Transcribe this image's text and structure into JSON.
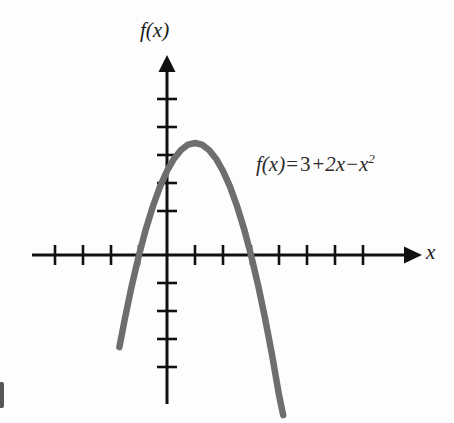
{
  "figure": {
    "background_color": "#fdfdfd",
    "axis_color": "#111111",
    "curve_color": "#6e6e6e",
    "ylabel": "f(x)",
    "xlabel": "x",
    "equation": {
      "lhs": "f(x)",
      "equals": "=",
      "term_constant": "3",
      "op_plus": "+",
      "term_linear": "2x",
      "op_minus": "−",
      "term_quadratic_base": "x",
      "term_quadratic_exponent": "2",
      "full_text": "f(x) = 3 + 2x − x²"
    }
  },
  "chart_data": {
    "type": "line",
    "title": "",
    "subtitle": "",
    "xlabel": "x",
    "ylabel": "f(x)",
    "annotations": [
      {
        "text": "f(x) = 3 + 2x − x²",
        "x": 3.2,
        "y": 3.6
      }
    ],
    "legend": [],
    "legend_position": "none",
    "grid": false,
    "axis_style": "arrows-both-ends",
    "xlim": [
      -4.9,
      7.6
    ],
    "ylim": [
      -4.9,
      5.9
    ],
    "xticks": [
      -4,
      -3,
      -2,
      -1,
      1,
      2,
      3,
      4,
      5,
      6,
      7
    ],
    "yticks": [
      -4,
      -3,
      -2,
      -1,
      1,
      2,
      3,
      4,
      5
    ],
    "xtick_labels": [],
    "ytick_labels": [],
    "function": "f(x) = 3 + 2x - x^2",
    "vertex": {
      "x": 1,
      "y": 4
    },
    "x_intercepts": [
      -1,
      3
    ],
    "y_intercept": 3,
    "opens": "down",
    "domain_drawn": [
      -1.7,
      4.15
    ],
    "series": [
      {
        "name": "f(x) = 3 + 2x − x²",
        "color": "#6e6e6e",
        "x": [
          -1.7,
          -1.5,
          -1.25,
          -1.0,
          -0.75,
          -0.5,
          -0.25,
          0.0,
          0.25,
          0.5,
          0.75,
          1.0,
          1.25,
          1.5,
          1.75,
          2.0,
          2.25,
          2.5,
          2.75,
          3.0,
          3.25,
          3.5,
          3.75,
          4.0,
          4.15
        ],
        "values": [
          -3.29,
          -2.25,
          -1.06,
          0.0,
          0.94,
          1.75,
          2.44,
          3.0,
          3.44,
          3.75,
          3.94,
          4.0,
          3.94,
          3.75,
          3.44,
          3.0,
          2.44,
          1.75,
          0.94,
          0.0,
          -1.06,
          -2.25,
          -3.56,
          -5.0,
          -5.72
        ]
      }
    ]
  }
}
